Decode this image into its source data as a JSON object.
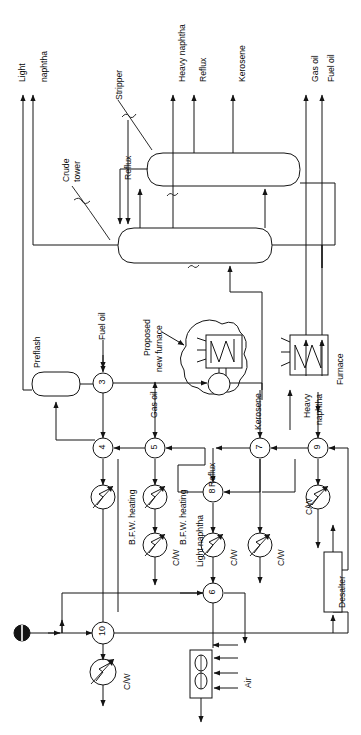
{
  "diagram": {
    "orientation": "rotated-90",
    "line_color": "#1a1a1a",
    "fill_color": "#ffffff"
  },
  "top_streams": [
    {
      "id": "light-naphtha-a",
      "label": "Light",
      "x": 23
    },
    {
      "id": "light-naphtha-b",
      "label": "naphtha",
      "x": 33
    },
    {
      "id": "heavy-naphtha",
      "label": "Heavy naphtha",
      "x": 173
    },
    {
      "id": "reflux-top",
      "label": "Reflux",
      "x": 194
    },
    {
      "id": "kerosene-top",
      "label": "Kerosene",
      "x": 233
    },
    {
      "id": "gas-oil-top",
      "label": "Gas oil",
      "x": 306
    },
    {
      "id": "fuel-oil-top",
      "label": "Fuel oil",
      "x": 322
    }
  ],
  "annotations": {
    "stripper": "Stripper",
    "crude_tower_line1": "Crude",
    "crude_tower_line2": "tower",
    "reflux_side": "Reflux",
    "preflash": "Preflash",
    "fuel_oil_feed": "Fuel oil",
    "proposed_line1": "Proposed",
    "proposed_line2": "new furnace",
    "furnace": "Furnace",
    "gas_oil_feed": "Gas oil",
    "kerosene_feed": "Kerosene",
    "heavy_naphtha_line1": "Heavy",
    "heavy_naphtha_line2": "naphtha",
    "reflux_mid": "Reflux",
    "light_naphtha_mid": "Light naphtha",
    "bfw_heating_1": "B.F.W. heating",
    "bfw_heating_2": "B.F.W. heating",
    "desalter": "Desalter",
    "air": "Air"
  },
  "coolers": [
    {
      "id": "cooler-4",
      "label": "",
      "x": 103,
      "y": 497
    },
    {
      "id": "cooler-5",
      "label": "",
      "x": 155,
      "y": 497
    },
    {
      "id": "cooler-5b",
      "label": "C/W",
      "x": 155,
      "y": 545
    },
    {
      "id": "cooler-8",
      "label": "C/W",
      "x": 213,
      "y": 545
    },
    {
      "id": "cooler-7",
      "label": "C/W",
      "x": 260,
      "y": 545
    },
    {
      "id": "cooler-9",
      "label": "C/W",
      "x": 318,
      "y": 497
    },
    {
      "id": "cooler-10",
      "label": "C/W",
      "x": 103,
      "y": 672
    }
  ],
  "cw_labels": [
    "C/W",
    "C/W",
    "C/W",
    "C/W",
    "C/W"
  ],
  "exchangers": [
    {
      "id": "exchanger-3",
      "number": "3",
      "x": 103,
      "y": 383
    },
    {
      "id": "exchanger-4",
      "number": "4",
      "x": 103,
      "y": 448
    },
    {
      "id": "exchanger-5",
      "number": "5",
      "x": 155,
      "y": 448
    },
    {
      "id": "exchanger-6",
      "number": "6",
      "x": 213,
      "y": 593
    },
    {
      "id": "exchanger-7",
      "number": "7",
      "x": 260,
      "y": 448
    },
    {
      "id": "exchanger-8",
      "number": "8",
      "x": 213,
      "y": 492
    },
    {
      "id": "exchanger-9",
      "number": "9",
      "x": 318,
      "y": 448
    },
    {
      "id": "exchanger-10",
      "number": "10",
      "x": 103,
      "y": 633
    }
  ],
  "vessels": [
    {
      "id": "stripper-vessel",
      "x": 147,
      "y": 153,
      "w": 153,
      "h": 33
    },
    {
      "id": "crude-tower-vessel",
      "x": 118,
      "y": 228,
      "w": 154,
      "h": 35
    },
    {
      "id": "preflash-drum",
      "x": 32,
      "y": 372,
      "w": 48,
      "h": 24
    }
  ],
  "equipment": {
    "furnace_box": {
      "id": "furnace",
      "x": 290,
      "y": 335,
      "w": 38,
      "h": 40
    },
    "proposed_furnace": {
      "id": "proposed-new-furnace",
      "x": 185,
      "y": 322,
      "w": 60,
      "h": 72
    },
    "desalter_box": {
      "id": "desalter",
      "x": 324,
      "y": 552,
      "w": 18,
      "h": 60
    },
    "air_cooler": {
      "id": "air-cooler",
      "x": 190,
      "y": 650,
      "w": 22,
      "h": 48
    },
    "crude_feed": {
      "id": "crude-feed-source",
      "x": 22,
      "y": 633
    }
  }
}
